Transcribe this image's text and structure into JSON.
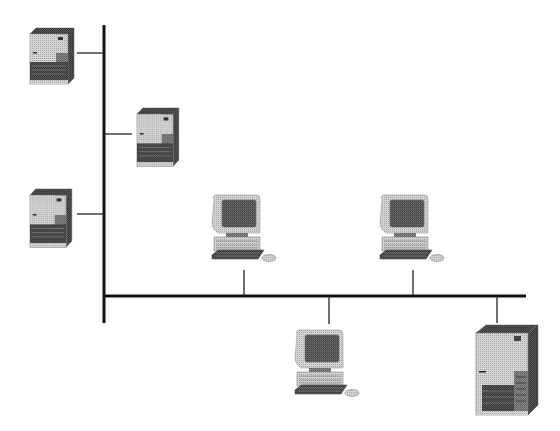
{
  "diagram": {
    "type": "bus-topology-network",
    "background": "#ffffff",
    "line_color": "#111111",
    "backbone": {
      "vertical": {
        "x": 104,
        "y1": 25,
        "y2": 323,
        "width": 3
      },
      "horizontal": {
        "y": 296,
        "x1": 104,
        "x2": 526,
        "width": 3
      }
    },
    "nodes": [
      {
        "id": "server-1",
        "kind": "tower-server",
        "x": 30,
        "y": 28,
        "w": 44,
        "h": 56,
        "link": {
          "x1": 77,
          "y1": 53,
          "x2": 104,
          "y2": 53
        }
      },
      {
        "id": "server-2",
        "kind": "tower-server",
        "x": 137,
        "y": 108,
        "w": 42,
        "h": 58,
        "link": {
          "x1": 104,
          "y1": 134,
          "x2": 132,
          "y2": 134
        }
      },
      {
        "id": "server-3",
        "kind": "tower-server",
        "x": 30,
        "y": 189,
        "w": 42,
        "h": 58,
        "link": {
          "x1": 77,
          "y1": 214,
          "x2": 104,
          "y2": 214
        }
      },
      {
        "id": "workstation-1",
        "kind": "desktop-pc",
        "x": 206,
        "y": 193,
        "w": 76,
        "h": 76,
        "link": {
          "x1": 244,
          "y1": 270,
          "x2": 244,
          "y2": 296
        }
      },
      {
        "id": "workstation-2",
        "kind": "desktop-pc",
        "x": 374,
        "y": 193,
        "w": 76,
        "h": 76,
        "link": {
          "x1": 413,
          "y1": 270,
          "x2": 413,
          "y2": 296
        }
      },
      {
        "id": "workstation-3",
        "kind": "desktop-pc",
        "x": 289,
        "y": 328,
        "w": 76,
        "h": 76,
        "link": {
          "x1": 329,
          "y1": 296,
          "x2": 329,
          "y2": 324
        }
      },
      {
        "id": "main-server",
        "kind": "large-tower-server",
        "x": 476,
        "y": 325,
        "w": 62,
        "h": 90,
        "link": {
          "x1": 497,
          "y1": 296,
          "x2": 497,
          "y2": 323
        }
      }
    ],
    "colors": {
      "case_light": "#c8c8c8",
      "case_mid": "#9a9a9a",
      "case_dark": "#555555",
      "screen": "#5a5a5a",
      "outline": "#444444"
    }
  }
}
